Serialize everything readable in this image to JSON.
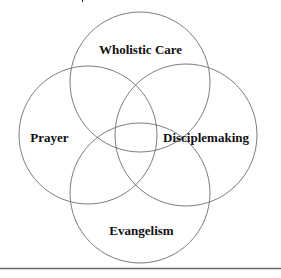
{
  "diagram": {
    "type": "four-circle-venn",
    "title_partially_visible": true,
    "circles": [
      {
        "id": "top",
        "label": "Wholistic Care",
        "cx": 140,
        "cy": 82,
        "r": 70
      },
      {
        "id": "left",
        "label": "Prayer",
        "cx": 88,
        "cy": 135,
        "r": 69
      },
      {
        "id": "right",
        "label": "Disciplemaking",
        "cx": 186,
        "cy": 135,
        "r": 71
      },
      {
        "id": "bottom",
        "label": "Evangelism",
        "cx": 140,
        "cy": 193,
        "r": 70
      }
    ],
    "labels": {
      "top": "Wholistic Care",
      "left": "Prayer",
      "right": "Disciplemaking",
      "bottom": "Evangelism"
    },
    "colors": {
      "stroke": "#6e6e6e",
      "text": "#111111",
      "background": "#ffffff",
      "rule": "#6a6a6a"
    }
  }
}
